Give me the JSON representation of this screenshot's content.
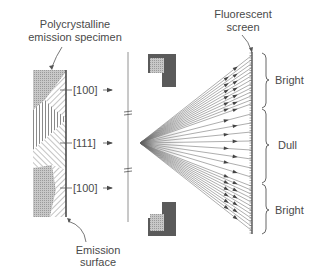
{
  "labels": {
    "specimen_line1": "Polycrystalline",
    "specimen_line2": "emission specimen",
    "screen_line1": "Fluorescent",
    "screen_line2": "screen",
    "surface_line1": "Emission",
    "surface_line2": "surface"
  },
  "directions": [
    {
      "text": "[100]",
      "y": 90
    },
    {
      "text": "[111]",
      "y": 143
    },
    {
      "text": "[100]",
      "y": 188
    }
  ],
  "zones": [
    {
      "text": "Bright",
      "y0": 52,
      "y1": 108
    },
    {
      "text": "Dull",
      "y0": 108,
      "y1": 183
    },
    {
      "text": "Bright",
      "y0": 183,
      "y1": 234
    }
  ],
  "colors": {
    "ink": "#4a4a4a",
    "light_gray": "#b8b8b8",
    "mid_gray": "#8c8c8c",
    "dark_gray": "#5a5a5a",
    "background": "#ffffff"
  }
}
